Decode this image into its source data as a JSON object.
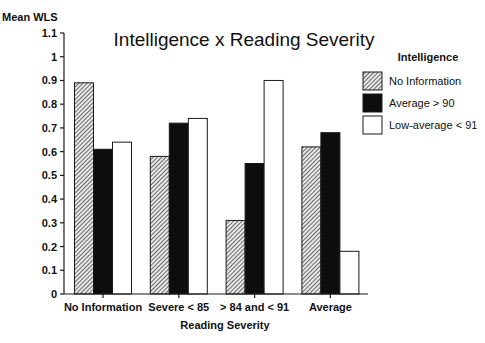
{
  "chart_data": {
    "type": "bar",
    "title": "Intelligence x Reading Severity",
    "xlabel": "Reading Severity",
    "ylabel": "Mean WLS",
    "ylim": [
      0,
      1.1
    ],
    "yticks": [
      "0",
      "0.1",
      "0.2",
      "0.3",
      "0.4",
      "0.5",
      "0.6",
      "0.7",
      "0.8",
      "0.9",
      "1",
      "1.1"
    ],
    "ytick_values": [
      0,
      0.1,
      0.2,
      0.3,
      0.4,
      0.5,
      0.6,
      0.7,
      0.8,
      0.9,
      1.0,
      1.1
    ],
    "categories": [
      "No Information",
      "Severe < 85",
      "> 84 and < 91",
      "Average"
    ],
    "legend_title": "Intelligence",
    "legend_position": "top-right",
    "grid": false,
    "series": [
      {
        "name": "No Information",
        "fill": "hatched",
        "values": [
          0.89,
          0.58,
          0.31,
          0.62
        ]
      },
      {
        "name": "Average > 90",
        "fill": "black",
        "values": [
          0.61,
          0.72,
          0.55,
          0.68
        ]
      },
      {
        "name": "Low-average < 91",
        "fill": "white",
        "values": [
          0.64,
          0.74,
          0.9,
          0.18
        ]
      }
    ]
  }
}
